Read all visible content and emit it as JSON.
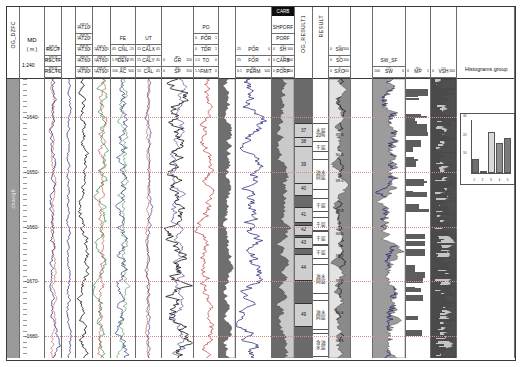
{
  "document": {
    "caption": "",
    "left_vertical_label": "OG_DZFC",
    "zone_label": "chang6"
  },
  "depth_track": {
    "name": "MD",
    "unit": "( m )",
    "scale": "1:240",
    "ticks": [
      "1640",
      "1650",
      "1660",
      "1670",
      "1680"
    ],
    "top_depth": 1633,
    "bottom_depth": 1684
  },
  "tracks": [
    {
      "id": "t_zone",
      "name": "zone-track",
      "header_rows": [],
      "vertical_label": "OG_DZFC"
    },
    {
      "id": "t_depth",
      "name": "depth-track",
      "header_rows": [
        {
          "label": "MD",
          "unit": "",
          "lo": "",
          "hi": ""
        },
        {
          "label": "( m )",
          "unit": "",
          "lo": "",
          "hi": ""
        },
        {
          "label": "1:240",
          "unit": "",
          "lo": "",
          "hi": ""
        }
      ]
    },
    {
      "id": "t_res1",
      "name": "shallow-resistivity-track",
      "header_rows": [
        {
          "label": "RSCT",
          "unit": "ohm.m",
          "lo": "0.2",
          "hi": "20"
        },
        {
          "label": "RSCTF",
          "unit": "ohm.m",
          "lo": "0.2",
          "hi": "20"
        },
        {
          "label": "RSCTO",
          "unit": "ohm.m",
          "lo": "0.2",
          "hi": "20"
        }
      ]
    },
    {
      "id": "t_at",
      "name": "array-induction-track",
      "header_rows": [
        {
          "label": "AT10",
          "unit": "ohm.m",
          "lo": "1",
          "hi": "1"
        },
        {
          "label": "AT20",
          "unit": "ohm.m",
          "lo": "1",
          "hi": "1"
        },
        {
          "label": "AT30",
          "unit": "ohm.m",
          "lo": "1",
          "hi": "1"
        },
        {
          "label": "AT60",
          "unit": "ohm.m",
          "lo": "1",
          "hi": "1"
        },
        {
          "label": "AT90",
          "unit": "ohm.m",
          "lo": "1",
          "hi": "1"
        }
      ]
    },
    {
      "id": "t_por",
      "name": "porosity-track",
      "header_rows": [
        {
          "label": "FE",
          "unit": "",
          "lo": "",
          "hi": ""
        },
        {
          "label": "CNL",
          "unit": "%",
          "lo": "45",
          "hi": "-15"
        },
        {
          "label": "DEN",
          "unit": "g/cm3",
          "lo": "1.95",
          "hi": "2.95"
        },
        {
          "label": "AC",
          "unit": "us/m",
          "lo": "100",
          "hi": "500"
        }
      ]
    },
    {
      "id": "t_cal",
      "name": "caliper-track",
      "header_rows": [
        {
          "label": "UT",
          "unit": "",
          "lo": "",
          "hi": ""
        },
        {
          "label": "CALX",
          "unit": "cm",
          "lo": "15",
          "hi": "45"
        },
        {
          "label": "CALY",
          "unit": "cm",
          "lo": "15",
          "hi": "45"
        },
        {
          "label": "CAL",
          "unit": "cm",
          "lo": "15",
          "hi": "45"
        }
      ]
    },
    {
      "id": "t_gr",
      "name": "gamma-ray-track",
      "header_rows": [
        {
          "label": "GR",
          "unit": "API",
          "lo": "0",
          "hi": "150"
        },
        {
          "label": "SP",
          "unit": "mV",
          "lo": "0",
          "hi": "150"
        }
      ]
    },
    {
      "id": "t_po",
      "name": "po-track",
      "header_rows": [
        {
          "label": "PO",
          "unit": "",
          "lo": "",
          "hi": ""
        },
        {
          "label": "POR",
          "unit": "%",
          "lo": "0",
          "hi": "1"
        },
        {
          "label": "TDR",
          "unit": "%",
          "lo": "0",
          "hi": "1"
        },
        {
          "label": "TO",
          "unit": "",
          "lo": "1.5",
          "hi": "0"
        },
        {
          "label": "FMIT",
          "unit": "",
          "lo": "1.5",
          "hi": "0"
        }
      ]
    },
    {
      "id": "t_perm",
      "name": "permeability-track",
      "header_rows": [
        {
          "label": "POR",
          "unit": "%",
          "lo": "25",
          "hi": "0"
        },
        {
          "label": "FOR",
          "unit": "%",
          "lo": "25",
          "hi": "0"
        },
        {
          "label": "PERM",
          "unit": "mD",
          "lo": "0.1",
          "hi": "100"
        }
      ]
    },
    {
      "id": "t_carb",
      "name": "carbonate-component-track",
      "banner": "CARB",
      "header_rows": [
        {
          "label": "SHPORF",
          "unit": "",
          "lo": "",
          "hi": ""
        },
        {
          "label": "PORF",
          "unit": "",
          "lo": "",
          "hi": ""
        },
        {
          "label": "SH",
          "unit": "(%)",
          "lo": "0",
          "hi": "100"
        },
        {
          "label": "CARB",
          "unit": "(%)",
          "lo": "0",
          "hi": "100"
        },
        {
          "label": "PORF",
          "unit": "(%)",
          "lo": "0",
          "hi": "100"
        }
      ]
    },
    {
      "id": "t_res_num",
      "name": "layer-number-track",
      "vertical_label": "OG_RESULT1",
      "header_rows": []
    },
    {
      "id": "t_result",
      "name": "interpretation-result-track",
      "vertical_label": "RESULT",
      "header_rows": []
    },
    {
      "id": "t_sat",
      "name": "saturation-track",
      "header_rows": [
        {
          "label": "SW",
          "unit": "%",
          "lo": "0",
          "hi": "100"
        },
        {
          "label": "SO",
          "unit": "%",
          "lo": "0",
          "hi": "100"
        },
        {
          "label": "SXO",
          "unit": "%",
          "lo": "0",
          "hi": "100"
        }
      ]
    },
    {
      "id": "t_sw",
      "name": "sw-curve-track",
      "header_rows": [
        {
          "label": "SW_SF",
          "unit": "",
          "lo": "",
          "hi": ""
        },
        {
          "label": "SW",
          "unit": "(%)",
          "lo": "100",
          "hi": "0"
        }
      ]
    },
    {
      "id": "t_mp",
      "name": "mp-bar-track",
      "header_rows": [
        {
          "label": "MP",
          "unit": "mD",
          "lo": "0",
          "hi": "1"
        }
      ]
    },
    {
      "id": "t_vsh",
      "name": "vsh-track",
      "header_rows": [
        {
          "label": "VSH",
          "unit": "(%)",
          "lo": "0",
          "hi": "100"
        }
      ]
    }
  ],
  "layer_numbers": [
    {
      "label": "37",
      "top": 1641.0,
      "bottom": 1643.6
    },
    {
      "label": "38",
      "top": 1643.6,
      "bottom": 1645.2
    },
    {
      "label": "39",
      "top": 1645.2,
      "bottom": 1652.0
    },
    {
      "label": "40",
      "top": 1652.0,
      "bottom": 1654.0
    },
    {
      "label": "41",
      "top": 1656.4,
      "bottom": 1659.0
    },
    {
      "label": "42",
      "top": 1659.6,
      "bottom": 1661.4
    },
    {
      "label": "43",
      "top": 1661.8,
      "bottom": 1663.8
    },
    {
      "label": "44",
      "top": 1665.0,
      "bottom": 1669.6
    },
    {
      "label": "49",
      "top": 1674.0,
      "bottom": 1678.0
    }
  ],
  "result_rows": [
    {
      "label": "水层",
      "sub": "20%",
      "top": 1641.0,
      "bottom": 1644.4
    },
    {
      "label": "干层",
      "sub": "",
      "top": 1644.4,
      "bottom": 1646.0
    },
    {
      "label": "油水",
      "sub": "同层",
      "top": 1647.6,
      "bottom": 1653.0
    },
    {
      "label": "干层",
      "sub": "",
      "top": 1654.8,
      "bottom": 1657.0
    },
    {
      "label": "干层",
      "sub": "",
      "top": 1658.2,
      "bottom": 1660.4
    },
    {
      "label": "干层",
      "sub": "",
      "top": 1660.8,
      "bottom": 1663.0
    },
    {
      "label": "干层",
      "sub": "",
      "top": 1663.4,
      "bottom": 1665.6
    },
    {
      "label": "油水",
      "sub": "同层",
      "top": 1666.8,
      "bottom": 1672.0
    },
    {
      "label": "油水",
      "sub": "同层",
      "top": 1673.4,
      "bottom": 1678.6
    },
    {
      "label": "含油",
      "sub": "水层",
      "top": 1679.4,
      "bottom": 1683.4
    }
  ],
  "sat_values": [
    {
      "label": "39.6",
      "top": 1641.0,
      "bottom": 1645.0
    },
    {
      "label": "30.5",
      "top": 1645.4,
      "bottom": 1648.0
    },
    {
      "label": "39.6",
      "top": 1649.0,
      "bottom": 1654.0
    },
    {
      "label": "38.8",
      "top": 1655.0,
      "bottom": 1659.0
    },
    {
      "label": "30.6",
      "top": 1659.4,
      "bottom": 1663.0
    },
    {
      "label": "33.2",
      "top": 1663.4,
      "bottom": 1667.0
    },
    {
      "label": "36.6",
      "top": 1667.4,
      "bottom": 1672.0
    },
    {
      "label": "30.6",
      "top": 1673.0,
      "bottom": 1678.0
    },
    {
      "label": "38.5",
      "top": 1678.4,
      "bottom": 1683.0
    }
  ],
  "histogram": {
    "label": "Histograms group",
    "chart_data": {
      "type": "bar",
      "title": "",
      "categories": [
        "1",
        "2",
        "3",
        "4",
        "5"
      ],
      "values": [
        8,
        1,
        23,
        17,
        20
      ],
      "colors": [
        "#6e6e6e",
        "#e8e8e8",
        "#d9d9d9",
        "#8d8d8d",
        "#7a7a7a"
      ],
      "ylabel": "",
      "xlabel": "",
      "ylim": [
        0,
        30
      ],
      "yticks": [
        "10",
        "20",
        "30"
      ],
      "grid": false,
      "legend": "none"
    }
  },
  "colors": {
    "frame": "#3a3a3a",
    "gridline": "#6d6d6d",
    "curve_dark": "#1a1a6e",
    "curve_red": "#b42222",
    "curve_green": "#1f7a2e",
    "curve_black": "#111111",
    "shale_fill": "#7d7d7d",
    "sand_fill": "#d8d8d8",
    "banner": "#0d0d0d",
    "oil_fill": "#8f8f8f"
  }
}
